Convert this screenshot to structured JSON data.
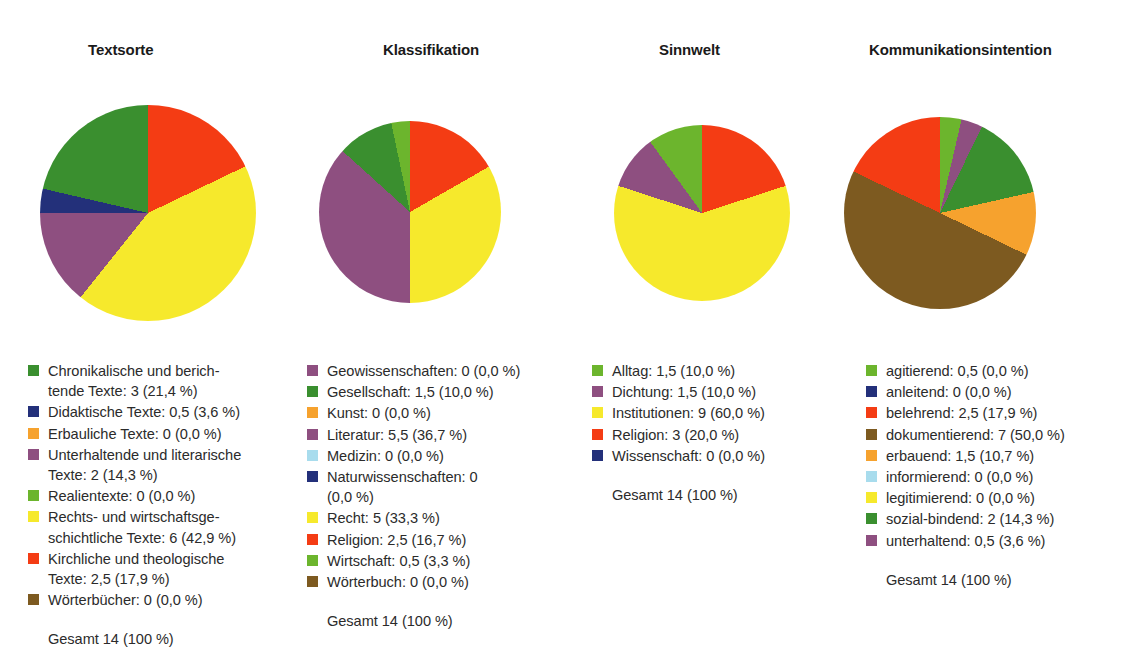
{
  "page": {
    "background": "#ffffff",
    "text_color": "#2b2b2b"
  },
  "palette": {
    "dark_green": "#3a8f2f",
    "navy": "#23307a",
    "orange": "#f6a22e",
    "purple": "#8e4f80",
    "light_green": "#6cb52d",
    "yellow": "#f6e92c",
    "red": "#f43c14",
    "brown": "#7d5a20",
    "light_blue": "#a8dced"
  },
  "charts": [
    {
      "id": "textsorte",
      "title": "Textsorte",
      "total_label": "Gesamt 14 (100 %)",
      "slices": [
        {
          "label": "Chronikalische und berich-\ntende Texte: 3 (21,4 %)",
          "value": 3,
          "percent": 21.4,
          "color": "#3a8f2f"
        },
        {
          "label": "Didaktische Texte: 0,5 (3,6 %)",
          "value": 0.5,
          "percent": 3.6,
          "color": "#23307a"
        },
        {
          "label": "Erbauliche Texte: 0 (0,0 %)",
          "value": 0,
          "percent": 0.0,
          "color": "#f6a22e"
        },
        {
          "label": "Unterhaltende und literarische\nTexte: 2 (14,3 %)",
          "value": 2,
          "percent": 14.3,
          "color": "#8e4f80"
        },
        {
          "label": "Realientexte: 0 (0,0 %)",
          "value": 0,
          "percent": 0.0,
          "color": "#6cb52d"
        },
        {
          "label": "Rechts- und wirtschaftsge-\nschichtliche Texte: 6 (42,9 %)",
          "value": 6,
          "percent": 42.9,
          "color": "#f6e92c"
        },
        {
          "label": "Kirchliche und theologische\nTexte: 2,5 (17,9 %)",
          "value": 2.5,
          "percent": 17.9,
          "color": "#f43c14"
        },
        {
          "label": "Wörterbücher: 0 (0,0 %)",
          "value": 0,
          "percent": 0.0,
          "color": "#7d5a20"
        }
      ],
      "wedge_order": [
        {
          "name": "Kirchliche und theologische Texte",
          "percent": 17.9,
          "color": "#f43c14"
        },
        {
          "name": "Rechts- und wirtschaftsgeschichtliche Texte",
          "percent": 42.9,
          "color": "#f6e92c"
        },
        {
          "name": "Unterhaltende und literarische Texte",
          "percent": 14.3,
          "color": "#8e4f80"
        },
        {
          "name": "Didaktische Texte",
          "percent": 3.6,
          "color": "#23307a"
        },
        {
          "name": "Chronikalische und berichtende Texte",
          "percent": 21.4,
          "color": "#3a8f2f"
        }
      ]
    },
    {
      "id": "klassifikation",
      "title": "Klassifikation",
      "total_label": "Gesamt 14 (100 %)",
      "slices": [
        {
          "label": "Geowissenschaften: 0 (0,0 %)",
          "value": 0,
          "percent": 0.0,
          "color": "#8e4f80"
        },
        {
          "label": "Gesellschaft: 1,5 (10,0 %)",
          "value": 1.5,
          "percent": 10.0,
          "color": "#3a8f2f"
        },
        {
          "label": "Kunst: 0 (0,0 %)",
          "value": 0,
          "percent": 0.0,
          "color": "#f6a22e"
        },
        {
          "label": "Literatur: 5,5 (36,7 %)",
          "value": 5.5,
          "percent": 36.7,
          "color": "#8e4f80"
        },
        {
          "label": "Medizin: 0 (0,0 %)",
          "value": 0,
          "percent": 0.0,
          "color": "#a8dced"
        },
        {
          "label": "Naturwissenschaften: 0\n(0,0 %)",
          "value": 0,
          "percent": 0.0,
          "color": "#23307a"
        },
        {
          "label": "Recht: 5 (33,3 %)",
          "value": 5,
          "percent": 33.3,
          "color": "#f6e92c"
        },
        {
          "label": "Religion: 2,5 (16,7 %)",
          "value": 2.5,
          "percent": 16.7,
          "color": "#f43c14"
        },
        {
          "label": "Wirtschaft: 0,5 (3,3 %)",
          "value": 0.5,
          "percent": 3.3,
          "color": "#6cb52d"
        },
        {
          "label": "Wörterbuch: 0 (0,0 %)",
          "value": 0,
          "percent": 0.0,
          "color": "#7d5a20"
        }
      ],
      "wedge_order": [
        {
          "name": "Religion",
          "percent": 16.7,
          "color": "#f43c14"
        },
        {
          "name": "Recht",
          "percent": 33.3,
          "color": "#f6e92c"
        },
        {
          "name": "Literatur",
          "percent": 36.7,
          "color": "#8e4f80"
        },
        {
          "name": "Gesellschaft",
          "percent": 10.0,
          "color": "#3a8f2f"
        },
        {
          "name": "Wirtschaft",
          "percent": 3.3,
          "color": "#6cb52d"
        }
      ]
    },
    {
      "id": "sinnwelt",
      "title": "Sinnwelt",
      "total_label": "Gesamt 14 (100 %)",
      "slices": [
        {
          "label": "Alltag: 1,5 (10,0 %)",
          "value": 1.5,
          "percent": 10.0,
          "color": "#6cb52d"
        },
        {
          "label": "Dichtung: 1,5 (10,0 %)",
          "value": 1.5,
          "percent": 10.0,
          "color": "#8e4f80"
        },
        {
          "label": "Institutionen: 9 (60,0 %)",
          "value": 9,
          "percent": 60.0,
          "color": "#f6e92c"
        },
        {
          "label": "Religion: 3 (20,0 %)",
          "value": 3,
          "percent": 20.0,
          "color": "#f43c14"
        },
        {
          "label": "Wissenschaft: 0 (0,0 %)",
          "value": 0,
          "percent": 0.0,
          "color": "#23307a"
        }
      ],
      "wedge_order": [
        {
          "name": "Religion",
          "percent": 20.0,
          "color": "#f43c14"
        },
        {
          "name": "Institutionen",
          "percent": 60.0,
          "color": "#f6e92c"
        },
        {
          "name": "Dichtung",
          "percent": 10.0,
          "color": "#8e4f80"
        },
        {
          "name": "Alltag",
          "percent": 10.0,
          "color": "#6cb52d"
        }
      ]
    },
    {
      "id": "kommunikationsintention",
      "title": "Kommunikationsintention",
      "total_label": "Gesamt 14 (100 %)",
      "slices": [
        {
          "label": "agitierend: 0,5 (0,0 %)",
          "value": 0.5,
          "percent": 0.0,
          "color": "#6cb52d"
        },
        {
          "label": "anleitend: 0 (0,0 %)",
          "value": 0,
          "percent": 0.0,
          "color": "#23307a"
        },
        {
          "label": "belehrend: 2,5 (17,9 %)",
          "value": 2.5,
          "percent": 17.9,
          "color": "#f43c14"
        },
        {
          "label": "dokumentierend: 7 (50,0 %)",
          "value": 7,
          "percent": 50.0,
          "color": "#7d5a20"
        },
        {
          "label": "erbauend: 1,5 (10,7 %)",
          "value": 1.5,
          "percent": 10.7,
          "color": "#f6a22e"
        },
        {
          "label": "informierend: 0 (0,0 %)",
          "value": 0,
          "percent": 0.0,
          "color": "#a8dced"
        },
        {
          "label": "legitimierend: 0 (0,0 %)",
          "value": 0,
          "percent": 0.0,
          "color": "#f6e92c"
        },
        {
          "label": "sozial-bindend: 2 (14,3 %)",
          "value": 2,
          "percent": 14.3,
          "color": "#3a8f2f"
        },
        {
          "label": "unterhaltend: 0,5 (3,6 %)",
          "value": 0.5,
          "percent": 3.6,
          "color": "#8e4f80"
        }
      ],
      "wedge_order": [
        {
          "name": "agitierend",
          "percent": 3.6,
          "color": "#6cb52d"
        },
        {
          "name": "unterhaltend",
          "percent": 3.6,
          "color": "#8e4f80"
        },
        {
          "name": "sozial-bindend",
          "percent": 14.3,
          "color": "#3a8f2f"
        },
        {
          "name": "erbauend",
          "percent": 10.7,
          "color": "#f6a22e"
        },
        {
          "name": "dokumentierend",
          "percent": 50.0,
          "color": "#7d5a20"
        },
        {
          "name": "belehrend",
          "percent": 17.9,
          "color": "#f43c14"
        }
      ]
    }
  ],
  "chart_data": {
    "type": "pie",
    "title": "",
    "legend_position": "below",
    "panels": [
      {
        "title": "Textsorte",
        "total": 14,
        "total_label": "Gesamt 14 (100 %)",
        "categories": [
          "Chronikalische und berichtende Texte",
          "Didaktische Texte",
          "Erbauliche Texte",
          "Unterhaltende und literarische Texte",
          "Realientexte",
          "Rechts- und wirtschaftsgeschichtliche Texte",
          "Kirchliche und theologische Texte",
          "Wörterbücher"
        ],
        "values": [
          3,
          0.5,
          0,
          2,
          0,
          6,
          2.5,
          0
        ],
        "percents": [
          21.4,
          3.6,
          0.0,
          14.3,
          0.0,
          42.9,
          17.9,
          0.0
        ],
        "colors": [
          "#3a8f2f",
          "#23307a",
          "#f6a22e",
          "#8e4f80",
          "#6cb52d",
          "#f6e92c",
          "#f43c14",
          "#7d5a20"
        ]
      },
      {
        "title": "Klassifikation",
        "total": 14,
        "total_label": "Gesamt 14 (100 %)",
        "categories": [
          "Geowissenschaften",
          "Gesellschaft",
          "Kunst",
          "Literatur",
          "Medizin",
          "Naturwissenschaften",
          "Recht",
          "Religion",
          "Wirtschaft",
          "Wörterbuch"
        ],
        "values": [
          0,
          1.5,
          0,
          5.5,
          0,
          0,
          5,
          2.5,
          0.5,
          0
        ],
        "percents": [
          0.0,
          10.0,
          0.0,
          36.7,
          0.0,
          0.0,
          33.3,
          16.7,
          3.3,
          0.0
        ],
        "colors": [
          "#8e4f80",
          "#3a8f2f",
          "#f6a22e",
          "#8e4f80",
          "#a8dced",
          "#23307a",
          "#f6e92c",
          "#f43c14",
          "#6cb52d",
          "#7d5a20"
        ]
      },
      {
        "title": "Sinnwelt",
        "total": 14,
        "total_label": "Gesamt 14 (100 %)",
        "categories": [
          "Alltag",
          "Dichtung",
          "Institutionen",
          "Religion",
          "Wissenschaft"
        ],
        "values": [
          1.5,
          1.5,
          9,
          3,
          0
        ],
        "percents": [
          10.0,
          10.0,
          60.0,
          20.0,
          0.0
        ],
        "colors": [
          "#6cb52d",
          "#8e4f80",
          "#f6e92c",
          "#f43c14",
          "#23307a"
        ]
      },
      {
        "title": "Kommunikationsintention",
        "total": 14,
        "total_label": "Gesamt 14 (100 %)",
        "categories": [
          "agitierend",
          "anleitend",
          "belehrend",
          "dokumentierend",
          "erbauend",
          "informierend",
          "legitimierend",
          "sozial-bindend",
          "unterhaltend"
        ],
        "values": [
          0.5,
          0,
          2.5,
          7,
          1.5,
          0,
          0,
          2,
          0.5
        ],
        "percents": [
          0.0,
          0.0,
          17.9,
          50.0,
          10.7,
          0.0,
          0.0,
          14.3,
          3.6
        ],
        "colors": [
          "#6cb52d",
          "#23307a",
          "#f43c14",
          "#7d5a20",
          "#f6a22e",
          "#a8dced",
          "#f6e92c",
          "#3a8f2f",
          "#8e4f80"
        ]
      }
    ]
  },
  "geometry": {
    "panels": [
      {
        "title_x": 88,
        "pie_cx": 148,
        "pie_cy": 213,
        "pie_r": 108,
        "legend_x": 28,
        "legend_y": 361
      },
      {
        "title_x": 383,
        "pie_cx": 410,
        "pie_cy": 212,
        "pie_r": 91,
        "legend_x": 307,
        "legend_y": 361
      },
      {
        "title_x": 659,
        "pie_cx": 702,
        "pie_cy": 213,
        "pie_r": 88,
        "legend_x": 592,
        "legend_y": 361
      },
      {
        "title_x": 869,
        "pie_cx": 940,
        "pie_cy": 213,
        "pie_r": 96,
        "legend_x": 866,
        "legend_y": 361
      }
    ]
  }
}
